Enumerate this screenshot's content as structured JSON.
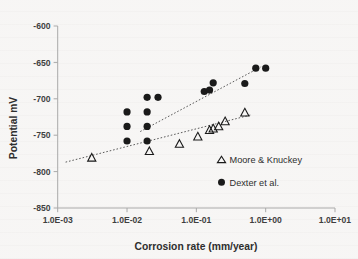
{
  "chart_data": {
    "type": "scatter",
    "title": "",
    "xlabel": "Corrosion rate (mm/year)",
    "ylabel": "Potential mV",
    "xscale": "log",
    "yscale": "linear",
    "xlim": [
      0.001,
      10
    ],
    "ylim": [
      -850,
      -600
    ],
    "grid": false,
    "legend_position": "inside-right",
    "xticklabels": [
      "1.0E-03",
      "1.0E-02",
      "1.0E-01",
      "1.0E+00",
      "1.0E+01"
    ],
    "xtickvalues": [
      0.001,
      0.01,
      0.1,
      1,
      10
    ],
    "yticklabels": [
      "-600",
      "-650",
      "-700",
      "-750",
      "-800",
      "-850"
    ],
    "ytickvalues": [
      -600,
      -650,
      -700,
      -750,
      -800,
      -850
    ],
    "series": [
      {
        "name": "Moore & Knuckey",
        "marker": "open-triangle",
        "color": "#1a1a1a",
        "points": [
          [
            0.0031,
            -781
          ],
          [
            0.021,
            -772
          ],
          [
            0.057,
            -762
          ],
          [
            0.105,
            -752
          ],
          [
            0.155,
            -743
          ],
          [
            0.175,
            -741
          ],
          [
            0.21,
            -738
          ],
          [
            0.26,
            -731
          ],
          [
            0.5,
            -719
          ]
        ],
        "trendline": {
          "x0": 0.0013,
          "y0": -787,
          "x1": 0.62,
          "y1": -722
        }
      },
      {
        "name": "Dexter et al.",
        "marker": "filled-circle",
        "color": "#1a1a1a",
        "points": [
          [
            0.01,
            -718
          ],
          [
            0.01,
            -738
          ],
          [
            0.01,
            -758
          ],
          [
            0.0195,
            -698
          ],
          [
            0.0195,
            -718
          ],
          [
            0.0195,
            -738
          ],
          [
            0.0195,
            -758
          ],
          [
            0.028,
            -698
          ],
          [
            0.13,
            -690
          ],
          [
            0.155,
            -688
          ],
          [
            0.175,
            -678
          ],
          [
            0.5,
            -679
          ],
          [
            0.72,
            -658
          ],
          [
            1.0,
            -658
          ]
        ],
        "trendline": {
          "x0": 0.0155,
          "y0": -745,
          "x1": 0.86,
          "y1": -656
        }
      }
    ]
  },
  "axes": {
    "x_title": "Corrosion rate (mm/year)",
    "y_title": "Potential mV"
  },
  "legend": {
    "entries": [
      {
        "label": "Moore & Knuckey",
        "marker": "open-triangle"
      },
      {
        "label": "Dexter et al.",
        "marker": "filled-circle"
      }
    ]
  }
}
